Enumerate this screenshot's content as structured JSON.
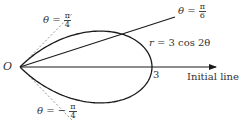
{
  "diagram": {
    "type": "polar-curve",
    "equation": {
      "lhs": "r",
      "rhs": "= 3 cos 2θ"
    },
    "pole_label": "O",
    "intercept_label": "3",
    "initial_line_label": "Initial line",
    "lines": [
      {
        "name": "theta-pi-over-6",
        "prefix": "θ =",
        "num": "π",
        "den": "6",
        "style": "solid"
      },
      {
        "name": "theta-pi-over-4",
        "prefix": "θ =",
        "num": "π",
        "den": "4",
        "style": "dashed"
      },
      {
        "name": "theta-minus-pi-over-4",
        "prefix": "θ = −",
        "num": "π",
        "den": "4",
        "style": "dashed"
      }
    ],
    "colors": {
      "curve": "#1a1a1a",
      "line": "#1a1a1a",
      "dashed": "#888888",
      "text": "#333333"
    }
  }
}
